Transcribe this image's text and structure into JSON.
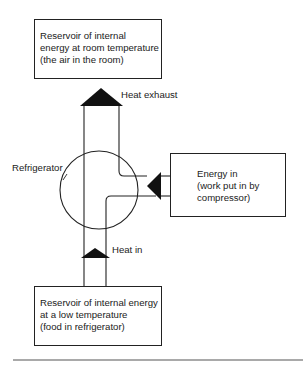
{
  "diagram": {
    "type": "energy-flow",
    "nodes": {
      "hot_reservoir": {
        "lines": [
          "Reservoir of internal",
          "energy at room temperature",
          "(the air in the room)"
        ]
      },
      "refrigerator": {
        "label": "Refrigerator"
      },
      "energy_input": {
        "lines": [
          "Energy in",
          "(work put in by",
          "compressor)"
        ]
      },
      "cold_reservoir": {
        "lines": [
          "Reservoir of internal energy",
          "at a low temperature",
          "(food in refrigerator)"
        ]
      }
    },
    "flows": {
      "heat_exhaust": {
        "label": "Heat exhaust",
        "from": "refrigerator",
        "to": "hot_reservoir",
        "direction": "up"
      },
      "energy_in": {
        "from": "energy_input",
        "to": "refrigerator",
        "direction": "left"
      },
      "heat_in": {
        "label": "Heat in",
        "from": "cold_reservoir",
        "to": "refrigerator",
        "direction": "up"
      }
    },
    "colors": {
      "stroke": "#222222",
      "arrow_fill": "#111111",
      "background": "#ffffff",
      "rule": "#555555"
    }
  }
}
